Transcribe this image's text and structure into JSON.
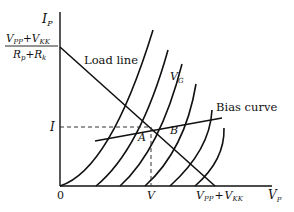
{
  "diagram": {
    "axes": {
      "y_label_main": "I",
      "y_label_sub": "P",
      "x_label_main": "V",
      "x_label_sub": "P",
      "origin_label": "0"
    },
    "y_intercept": {
      "numerator": {
        "t1": "V",
        "t1sub": "PP",
        "plus": "+",
        "t2": "V",
        "t2sub": "KK"
      },
      "denominator": {
        "t1": "R",
        "t1sub": "p",
        "plus": "+",
        "t2": "R",
        "t2sub": "k"
      }
    },
    "x_intercept": {
      "t1": "V",
      "t1sub": "PP",
      "plus": "+",
      "t2": "V",
      "t2sub": "KK"
    },
    "load_line_label": "Load line",
    "vg_label_main": "V",
    "vg_label_sub": "G",
    "bias_curve_label": "Bias curve",
    "operating_current_label": "I",
    "operating_voltage_label": "V",
    "point_a_label": "A",
    "point_b_label": "B"
  }
}
